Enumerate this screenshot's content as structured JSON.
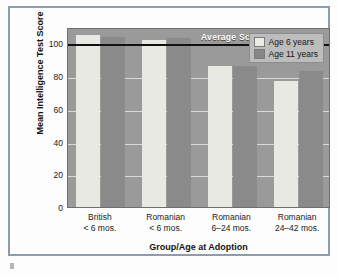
{
  "chart_data": {
    "type": "bar",
    "title": "",
    "xlabel": "Group/Age at Adoption",
    "ylabel": "Mean Intelligence Test Score",
    "categories": [
      {
        "line1": "British",
        "line2": "< 6 mos."
      },
      {
        "line1": "Romanian",
        "line2": "< 6 mos."
      },
      {
        "line1": "Romanian",
        "line2": "6–24 mos."
      },
      {
        "line1": "Romanian",
        "line2": "24–42 mos."
      }
    ],
    "series": [
      {
        "name": "Age 6 years",
        "color": "#e9e9e4",
        "values": [
          105,
          102,
          86,
          77
        ]
      },
      {
        "name": "Age 11 years",
        "color": "#8a8a8a",
        "values": [
          104,
          103,
          86,
          83
        ]
      }
    ],
    "ylim": [
      0,
      110
    ],
    "yticks": [
      0,
      20,
      40,
      60,
      80,
      100
    ],
    "ytick_labels": [
      "0",
      "20",
      "40",
      "60",
      "80",
      "100"
    ],
    "grid": true,
    "legend_position": "top-right",
    "annotations": [
      {
        "name": "average-score-line",
        "label": "Average Score",
        "value": 100,
        "color": "#111111"
      }
    ]
  },
  "legend": {
    "items": [
      {
        "label": "Age 6 years",
        "swatch": "light"
      },
      {
        "label": "Age 11 years",
        "swatch": "dark"
      }
    ]
  },
  "axes": {
    "y_title": "Mean Intelligence Test Score",
    "x_title": "Group/Age at Adoption"
  }
}
